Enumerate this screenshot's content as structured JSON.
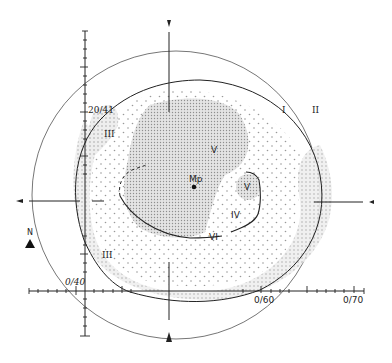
{
  "diagram": {
    "type": "visual-field-perimetry-chart",
    "colors": {
      "line": "#222222",
      "outer_circle": "#555555",
      "dense_stipple": "#bdbdbd",
      "light_stipple": "#d6d6d6",
      "background": "#ffffff"
    },
    "isopter_labels": {
      "I": "I",
      "II": "II",
      "III_top": "III",
      "III_bottom": "III",
      "IV": "IV",
      "V_top": "V",
      "V_right": "V",
      "VI": "VI"
    },
    "center_label": "Mp",
    "axis_labels": {
      "top_left": "20/41",
      "origin": "0/40",
      "x_mid": "0/60",
      "x_end": "0/70"
    },
    "north_label": "N"
  }
}
